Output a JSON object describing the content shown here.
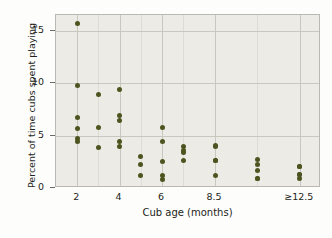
{
  "chart_data": {
    "type": "scatter",
    "title": "",
    "xlabel": "Cub age (months)",
    "ylabel": "Percent of time cubs spent playing",
    "xlim": [
      1.0,
      13.5
    ],
    "ylim": [
      0,
      16.5
    ],
    "ytick_labels": [
      "0",
      "5",
      "10",
      "15"
    ],
    "ytick_values": [
      0,
      5,
      10,
      15
    ],
    "xtick_labels": [
      "2",
      "4",
      "6",
      "8.5",
      "≥12.5"
    ],
    "xtick_values": [
      2,
      4,
      6,
      8.5,
      12.5
    ],
    "grid": "both",
    "legend": "none",
    "marker_color": "#4e5420",
    "plot_background": "#ecebe5",
    "series": [
      {
        "name": "cubs",
        "points": [
          {
            "x": 2,
            "y": 15.7
          },
          {
            "x": 2,
            "y": 9.8
          },
          {
            "x": 2,
            "y": 6.7
          },
          {
            "x": 2,
            "y": 5.7
          },
          {
            "x": 2,
            "y": 4.7
          },
          {
            "x": 2,
            "y": 4.4
          },
          {
            "x": 3,
            "y": 8.9
          },
          {
            "x": 3,
            "y": 5.8
          },
          {
            "x": 3,
            "y": 3.9
          },
          {
            "x": 4,
            "y": 9.4
          },
          {
            "x": 4,
            "y": 6.9
          },
          {
            "x": 4,
            "y": 6.4
          },
          {
            "x": 4,
            "y": 4.4
          },
          {
            "x": 4,
            "y": 4.0
          },
          {
            "x": 5,
            "y": 3.0
          },
          {
            "x": 5,
            "y": 2.2
          },
          {
            "x": 5,
            "y": 1.2
          },
          {
            "x": 6,
            "y": 5.8
          },
          {
            "x": 6,
            "y": 4.4
          },
          {
            "x": 6,
            "y": 2.5
          },
          {
            "x": 6,
            "y": 1.2
          },
          {
            "x": 6,
            "y": 0.8
          },
          {
            "x": 7,
            "y": 4.0
          },
          {
            "x": 7,
            "y": 3.6
          },
          {
            "x": 7,
            "y": 3.4
          },
          {
            "x": 7,
            "y": 2.6
          },
          {
            "x": 8.5,
            "y": 4.1
          },
          {
            "x": 8.5,
            "y": 4.0
          },
          {
            "x": 8.5,
            "y": 2.6
          },
          {
            "x": 8.5,
            "y": 2.6
          },
          {
            "x": 8.5,
            "y": 1.2
          },
          {
            "x": 10.5,
            "y": 2.7
          },
          {
            "x": 10.5,
            "y": 2.2
          },
          {
            "x": 10.5,
            "y": 1.7
          },
          {
            "x": 10.5,
            "y": 0.9
          },
          {
            "x": 10.5,
            "y": 0.9
          },
          {
            "x": 12.5,
            "y": 2.1
          },
          {
            "x": 12.5,
            "y": 2.1
          },
          {
            "x": 12.5,
            "y": 1.3
          },
          {
            "x": 12.5,
            "y": 1.3
          },
          {
            "x": 12.5,
            "y": 0.9
          }
        ]
      }
    ]
  }
}
